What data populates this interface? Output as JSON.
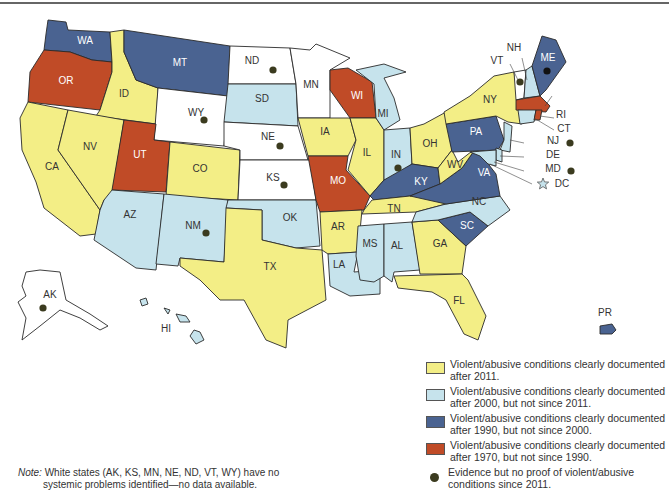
{
  "colors": {
    "after_2011": "#f3ee86",
    "after_2000": "#c6e3ec",
    "after_1990": "#4a6391",
    "after_1970": "#c04b27",
    "none": "#ffffff",
    "dot": "#3b3b1f"
  },
  "states": {
    "WA": {
      "label": "WA",
      "category": "after_1990"
    },
    "OR": {
      "label": "OR",
      "category": "after_1970"
    },
    "CA": {
      "label": "CA",
      "category": "after_2011"
    },
    "ID": {
      "label": "ID",
      "category": "after_2011"
    },
    "NV": {
      "label": "NV",
      "category": "after_2011"
    },
    "MT": {
      "label": "MT",
      "category": "after_1990"
    },
    "WY": {
      "label": "WY",
      "category": "none",
      "dot": true
    },
    "UT": {
      "label": "UT",
      "category": "after_1970"
    },
    "CO": {
      "label": "CO",
      "category": "after_2011"
    },
    "AZ": {
      "label": "AZ",
      "category": "after_2000"
    },
    "NM": {
      "label": "NM",
      "category": "after_2000",
      "dot": true
    },
    "ND": {
      "label": "ND",
      "category": "none",
      "dot": true
    },
    "SD": {
      "label": "SD",
      "category": "after_2000"
    },
    "NE": {
      "label": "NE",
      "category": "none",
      "dot": true
    },
    "KS": {
      "label": "KS",
      "category": "none",
      "dot": true
    },
    "OK": {
      "label": "OK",
      "category": "after_2000"
    },
    "TX": {
      "label": "TX",
      "category": "after_2011"
    },
    "MN": {
      "label": "MN",
      "category": "none"
    },
    "IA": {
      "label": "IA",
      "category": "after_2011"
    },
    "MO": {
      "label": "MO",
      "category": "after_1970"
    },
    "AR": {
      "label": "AR",
      "category": "after_2011"
    },
    "LA": {
      "label": "LA",
      "category": "after_2000"
    },
    "WI": {
      "label": "WI",
      "category": "after_1970"
    },
    "IL": {
      "label": "IL",
      "category": "after_2011"
    },
    "MI": {
      "label": "MI",
      "category": "after_2000"
    },
    "IN": {
      "label": "IN",
      "category": "after_2000",
      "dot": true
    },
    "OH": {
      "label": "OH",
      "category": "after_2011"
    },
    "KY": {
      "label": "KY",
      "category": "after_1990"
    },
    "TN": {
      "label": "TN",
      "category": "after_2011"
    },
    "MS": {
      "label": "MS",
      "category": "after_2000"
    },
    "AL": {
      "label": "AL",
      "category": "after_2000"
    },
    "GA": {
      "label": "GA",
      "category": "after_2011"
    },
    "FL": {
      "label": "FL",
      "category": "after_2011"
    },
    "SC": {
      "label": "SC",
      "category": "after_1990"
    },
    "NC": {
      "label": "NC",
      "category": "after_2000"
    },
    "VA": {
      "label": "VA",
      "category": "after_1990"
    },
    "WV": {
      "label": "WV",
      "category": "after_2011"
    },
    "PA": {
      "label": "PA",
      "category": "after_1990"
    },
    "NY": {
      "label": "NY",
      "category": "after_2011"
    },
    "VT": {
      "label": "VT",
      "category": "none",
      "dot": true
    },
    "NH": {
      "label": "NH",
      "category": "after_2000"
    },
    "ME": {
      "label": "ME",
      "category": "after_1990",
      "dot": true
    },
    "MA": {
      "label": "MA",
      "category": "after_1970"
    },
    "RI": {
      "label": "RI",
      "category": "after_1970"
    },
    "CT": {
      "label": "CT",
      "category": "after_2000"
    },
    "NJ": {
      "label": "NJ",
      "category": "after_2000",
      "dot": true
    },
    "DE": {
      "label": "DE",
      "category": "after_2000"
    },
    "MD": {
      "label": "MD",
      "category": "after_2000",
      "dot": true
    },
    "DC": {
      "label": "DC",
      "category": "after_2000",
      "marker": "star"
    },
    "AK": {
      "label": "AK",
      "category": "none",
      "dot": true
    },
    "HI": {
      "label": "HI",
      "category": "after_2000"
    },
    "PR": {
      "label": "PR",
      "category": "after_1990"
    }
  },
  "legend": [
    {
      "key": "after_2011",
      "text": "Violent/abusive conditions clearly documented after 2011."
    },
    {
      "key": "after_2000",
      "text": "Violent/abusive conditions clearly documented after 2000, but not since 2011."
    },
    {
      "key": "after_1990",
      "text": "Violent/abusive conditions clearly documented after 1990, but not since 2000."
    },
    {
      "key": "after_1970",
      "text": "Violent/abusive conditions clearly documented after 1970, but not since 1990."
    },
    {
      "key": "dot",
      "text": "Evidence but no proof of violent/abusive conditions since 2011."
    }
  ],
  "note": {
    "label": "Note:",
    "line1": " White states (AK, KS, MN, NE, ND, VT, WY) have no",
    "line2": "systemic problems identified—no data available."
  }
}
